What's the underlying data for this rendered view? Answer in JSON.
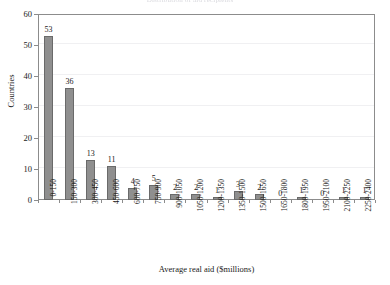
{
  "figure": {
    "cut_off_title_fragment": "Distribution of aid recipients",
    "ylabel": "Countries",
    "xlabel": "Average real aid ($millions)"
  },
  "chart_data": {
    "type": "bar",
    "title": "",
    "xlabel": "Average real aid ($millions)",
    "ylabel": "Countries",
    "ylim": [
      0,
      60
    ],
    "ytick_labels": [
      "0",
      "10",
      "20",
      "30",
      "40",
      "50",
      "60"
    ],
    "yticks": [
      0,
      10,
      20,
      30,
      40,
      50,
      60
    ],
    "grid": true,
    "legend": "none",
    "bar_color": "#8f8f8f",
    "bar_edge_color": "#6a6a6a",
    "categories": [
      "0-150",
      "150-300",
      "300-450",
      "450-600",
      "600-750",
      "750-900",
      "900-1050",
      "1050-1200",
      "1200-1350",
      "1350-1500",
      "1500-1650",
      "1650-1800",
      "1800-1950",
      "1950-2100",
      "2100-2250",
      "2250-2400"
    ],
    "values": [
      53,
      36,
      13,
      11,
      4,
      5,
      2,
      2,
      1,
      3,
      2,
      0,
      1,
      0,
      1,
      1
    ],
    "data_labels": [
      "53",
      "36",
      "13",
      "11",
      "4",
      "5",
      "2",
      "2",
      "1",
      "3",
      "2",
      "0",
      "1",
      "0",
      "1",
      "1"
    ]
  }
}
